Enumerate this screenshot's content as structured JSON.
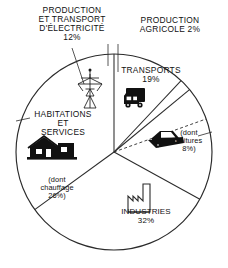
{
  "figure": {
    "background_color": "#ffffff",
    "line_color": "#2b2b2b",
    "fill_color": "#ffffff"
  },
  "labels": {
    "electricite": "PRODUCTION\nET TRANSPORT\nD'ÉLECTRICITÉ\n12%",
    "agricole": "PRODUCTION\nAGRICOLE 2%",
    "transports": "TRANSPORTS\n19%",
    "habitations": "HABITATIONS\nET\nSERVICES",
    "chauffage": "(dont\nchauffage\n26%)",
    "voitures": "(dont\nvoitures\n8%)",
    "industries": "INDUSTRIES\n32%"
  },
  "icons": {
    "pylon": "electricity-pylon-icon",
    "truck": "truck-icon",
    "car": "car-icon",
    "house": "house-icon",
    "factory": "factory-icon"
  },
  "chart_data": {
    "type": "pie",
    "categories": [
      "PRODUCTION ET TRANSPORT D'ÉLECTRICITÉ",
      "PRODUCTION AGRICOLE",
      "TRANSPORTS",
      "INDUSTRIES",
      "HABITATIONS ET SERVICES"
    ],
    "values": [
      12,
      2,
      19,
      32,
      35
    ],
    "unit": "%",
    "sub_slices": [
      {
        "parent": "TRANSPORTS",
        "label": "dont voitures",
        "value": 8
      },
      {
        "parent": "HABITATIONS ET SERVICES",
        "label": "dont chauffage",
        "value": 26
      }
    ],
    "center": {
      "x": 114,
      "y": 152
    },
    "radius": 98,
    "start_angle_deg": -90,
    "legend": "none",
    "grid": false
  }
}
